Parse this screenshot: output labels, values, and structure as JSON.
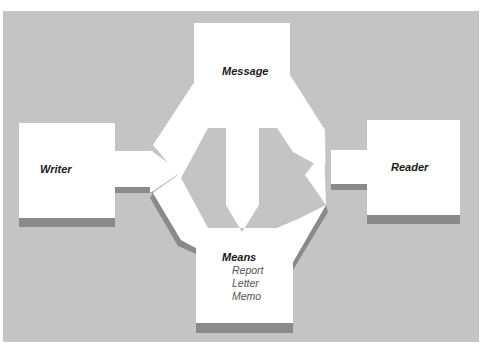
{
  "diagram": {
    "nodes": {
      "writer": {
        "label": "Writer"
      },
      "message": {
        "label": "Message"
      },
      "reader": {
        "label": "Reader"
      },
      "means": {
        "label": "Means",
        "items": [
          "Report",
          "Letter",
          "Memo"
        ]
      }
    },
    "edges": [
      {
        "from": "Writer",
        "to": "Message"
      },
      {
        "from": "Writer",
        "to": "Means"
      },
      {
        "from": "Message",
        "to": "Reader"
      },
      {
        "from": "Means",
        "to": "Reader"
      },
      {
        "from": "Message",
        "to": "Means"
      }
    ]
  },
  "colors": {
    "panel": "#c4c4c4",
    "box": "#ffffff",
    "shadow": "#8a8a8a"
  }
}
